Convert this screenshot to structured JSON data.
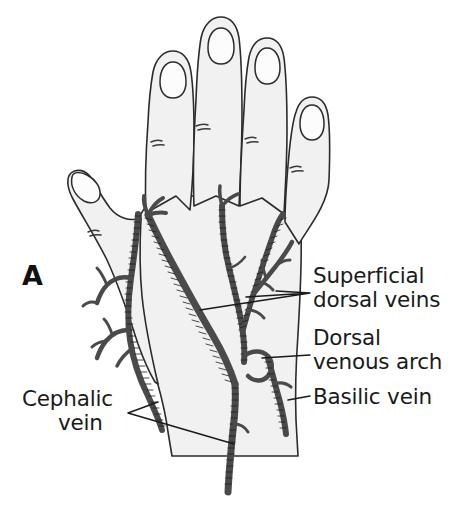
{
  "figure": {
    "panel_letter": "A",
    "background_color": "#ffffff",
    "skin_fill_color": "#f1f1f1",
    "outline_color": "#2b2b2b",
    "vein_color": "#4a4a4a",
    "label_color": "#1a1a1a"
  },
  "labels": [
    {
      "id": "superficial-dorsal-veins",
      "line1": "Superficial",
      "line2": "dorsal veins",
      "text_x": 313,
      "line1_y": 283,
      "line2_y": 307
    },
    {
      "id": "dorsal-venous-arch",
      "line1": "Dorsal",
      "line2": "venous arch",
      "text_x": 313,
      "line1_y": 345,
      "line2_y": 369
    },
    {
      "id": "basilic-vein",
      "line1": "Basilic vein",
      "line2": "",
      "text_x": 313,
      "line1_y": 404,
      "line2_y": 404
    },
    {
      "id": "cephalic-vein",
      "line1": "Cephalic",
      "line2": "vein",
      "text_x": 22,
      "line1_y": 406,
      "line2_y": 430
    }
  ],
  "anatomy_parts": [
    "index-finger",
    "middle-finger",
    "ring-finger",
    "little-finger",
    "thumb",
    "dorsum-of-hand",
    "wrist",
    "fingernails",
    "knuckle-creases"
  ],
  "vessels": [
    "superficial-dorsal-veins",
    "dorsal-venous-arch",
    "basilic-vein",
    "cephalic-vein"
  ]
}
